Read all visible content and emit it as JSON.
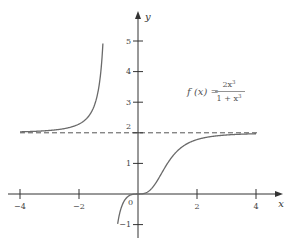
{
  "chart_data": {
    "type": "line",
    "title": "",
    "function_label": "f(x) = 2x^3 / (1 + x^3)",
    "formula": {
      "lhs": "f (x) =",
      "numerator": "2x",
      "numerator_exp": "3",
      "denominator": "1 + x",
      "denominator_exp": "3"
    },
    "xlabel": "x",
    "ylabel": "y",
    "xlim": [
      -4,
      4
    ],
    "ylim": [
      -1,
      5
    ],
    "x_ticks": [
      -4,
      -2,
      2,
      4
    ],
    "x_tick_labels": [
      "−4",
      "−2",
      "2",
      "4"
    ],
    "y_ticks": [
      1,
      2,
      3,
      4,
      5,
      -1
    ],
    "y_tick_labels": [
      "1",
      "2",
      "3",
      "4",
      "5",
      "−1"
    ],
    "origin_label": "0",
    "grid": false,
    "legend": null,
    "asymptotes": [
      {
        "type": "horizontal",
        "y": 2,
        "style": "dashed"
      }
    ],
    "series": [
      {
        "name": "f(x) left branch",
        "x": [
          -4,
          -3.5,
          -3,
          -2.5,
          -2,
          -1.75,
          -1.5,
          -1.35,
          -1.25,
          -1.19
        ],
        "values": [
          2.03,
          2.05,
          2.08,
          2.13,
          2.29,
          2.46,
          2.84,
          3.46,
          4.28,
          5.0
        ]
      },
      {
        "name": "f(x) right branch",
        "x": [
          -0.69,
          -0.6,
          -0.4,
          -0.2,
          0,
          0.2,
          0.4,
          0.6,
          0.8,
          1,
          1.25,
          1.5,
          2,
          2.5,
          3,
          3.5,
          4
        ],
        "values": [
          -1.0,
          -0.55,
          -0.14,
          -0.016,
          0,
          0.016,
          0.12,
          0.36,
          0.68,
          1.0,
          1.32,
          1.54,
          1.78,
          1.88,
          1.93,
          1.95,
          1.97
        ]
      }
    ],
    "colors": {
      "curve": "#6a6a6a",
      "axes": "#333333",
      "asymptote": "#555555"
    }
  }
}
